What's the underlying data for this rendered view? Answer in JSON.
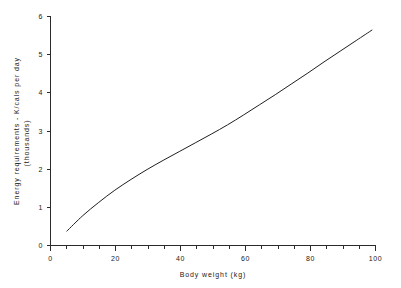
{
  "chart_data": {
    "type": "line",
    "title": "",
    "xlabel": "Body weight (kg)",
    "ylabel_line1": "Energy requirements - K/cals per day",
    "ylabel_line2": "(thousands)",
    "xlim": [
      0,
      101
    ],
    "ylim": [
      0,
      6
    ],
    "grid": false,
    "legend": "none",
    "x_ticks_major": [
      0,
      20,
      40,
      60,
      80,
      100
    ],
    "x_tick_labels": [
      "0",
      "20",
      "40",
      "60",
      "80",
      "100"
    ],
    "x_ticks_minor": [
      5,
      10,
      15,
      25,
      30,
      35,
      45,
      50,
      55,
      65,
      70,
      75,
      85,
      90,
      95
    ],
    "y_ticks_major": [
      0,
      1,
      2,
      3,
      4,
      5,
      6
    ],
    "y_tick_labels": [
      "0",
      "1",
      "2",
      "3",
      "4",
      "5",
      "6"
    ],
    "series": [
      {
        "name": "Energy requirement",
        "x": [
          5,
          10,
          15,
          20,
          25,
          30,
          35,
          40,
          45,
          50,
          55,
          60,
          65,
          70,
          75,
          80,
          85,
          90,
          95,
          100
        ],
        "values": [
          0.37,
          0.78,
          1.13,
          1.45,
          1.73,
          1.99,
          2.23,
          2.46,
          2.69,
          2.92,
          3.16,
          3.42,
          3.69,
          3.96,
          4.24,
          4.52,
          4.81,
          5.09,
          5.37,
          5.65
        ]
      }
    ]
  },
  "colors": {
    "curve": "#1f1f1f",
    "axis": "#2b2b2b",
    "text": "#1a1a1a",
    "background": "#ffffff"
  }
}
